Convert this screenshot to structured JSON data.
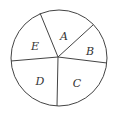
{
  "diagram": {
    "type": "pie-sectors",
    "stroke": "#444444",
    "background": "#ffffff",
    "circle": {
      "cx": 59,
      "cy": 58,
      "r": 48
    },
    "center": {
      "x": 58,
      "y": 57
    },
    "spokes": [
      {
        "x": 40,
        "y": 13
      },
      {
        "x": 93,
        "y": 25
      },
      {
        "x": 107,
        "y": 63
      },
      {
        "x": 57,
        "y": 106
      },
      {
        "x": 11,
        "y": 61
      }
    ],
    "sectors": [
      {
        "label": "A",
        "x": 64,
        "y": 37
      },
      {
        "label": "B",
        "x": 90,
        "y": 52
      },
      {
        "label": "C",
        "x": 77,
        "y": 84
      },
      {
        "label": "D",
        "x": 40,
        "y": 82
      },
      {
        "label": "E",
        "x": 35,
        "y": 47
      }
    ]
  }
}
